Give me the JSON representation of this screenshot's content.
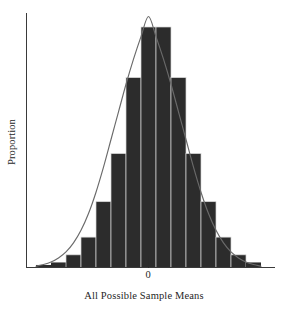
{
  "chart_data": {
    "type": "bar",
    "title": "",
    "subtitle": "",
    "xlabel": "All Possible Sample Means",
    "ylabel": "Proportion",
    "legend": [],
    "legend_position": "none",
    "grid": false,
    "xlim": [
      -7.5,
      7.5
    ],
    "ylim": [
      0,
      1
    ],
    "x_tick_labels": [
      "0"
    ],
    "x_tick_values": [
      0
    ],
    "y_tick_labels": [],
    "categories": [
      -7,
      -6,
      -5,
      -4,
      -3,
      -2,
      -1,
      0,
      1,
      2,
      3,
      4,
      5,
      6,
      7
    ],
    "values": [
      0.01,
      0.02,
      0.05,
      0.12,
      0.26,
      0.45,
      0.75,
      0.95,
      0.95,
      0.75,
      0.45,
      0.26,
      0.12,
      0.05,
      0.02
    ],
    "bar_width": 1.0,
    "series": [
      {
        "name": "Histogram of sample means",
        "type": "bar",
        "values": [
          0.01,
          0.02,
          0.05,
          0.12,
          0.26,
          0.45,
          0.75,
          0.95,
          0.95,
          0.75,
          0.45,
          0.26,
          0.12,
          0.05,
          0.02
        ]
      },
      {
        "name": "Normal curve overlay",
        "type": "line",
        "x": [
          -7.5,
          -7,
          -6.5,
          -6,
          -5.5,
          -5,
          -4.5,
          -4,
          -3.5,
          -3,
          -2.5,
          -2,
          -1.5,
          -1,
          -0.5,
          0,
          0.5,
          1,
          1.5,
          2,
          2.5,
          3,
          3.5,
          4,
          4.5,
          5,
          5.5,
          6,
          6.5,
          7,
          7.5
        ],
        "values": [
          0.005,
          0.012,
          0.022,
          0.038,
          0.062,
          0.098,
          0.148,
          0.215,
          0.3,
          0.4,
          0.51,
          0.62,
          0.73,
          0.83,
          0.92,
          1.0,
          0.92,
          0.83,
          0.73,
          0.62,
          0.51,
          0.4,
          0.3,
          0.215,
          0.148,
          0.098,
          0.062,
          0.038,
          0.022,
          0.012,
          0.005
        ]
      }
    ],
    "colors": {
      "bar_fill": "#2c2c2c",
      "bar_edge": "#d8d8d8",
      "curve": "#6a6a6a",
      "axis": "#3a3a3a",
      "background": "#ffffff",
      "text": "#1f1f1f"
    }
  },
  "axes": {
    "y_axis_label": "Proportion",
    "x_axis_label": "All Possible Sample Means",
    "zero_tick_label": "0"
  }
}
